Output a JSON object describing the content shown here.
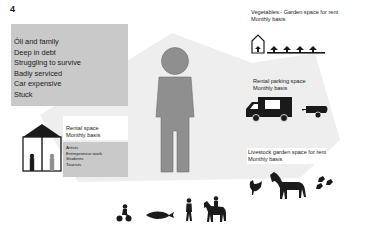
{
  "page": {
    "number": "4"
  },
  "status": {
    "lines": [
      "Óli and family",
      "Deep in debt",
      "Struggling to survive",
      "Badly serviced",
      "Car expensive",
      "Stuck"
    ]
  },
  "offers": {
    "vegetables": {
      "title": "Vegetables - Garden space for rent",
      "basis": "Monthly basis",
      "icon": "greenhouse-plants-icon"
    },
    "parking": {
      "title": "Rental parking space",
      "basis": "Monthly basis",
      "icon": "camper-trailer-icon"
    },
    "livestock": {
      "title": "Livestock garden space for rent",
      "basis": "Monthly basis",
      "icon": "horse-chickens-birds-icon"
    },
    "rental": {
      "title": "Rental space",
      "basis": "Monthly basis",
      "uses": [
        "Artists",
        "Entrepreneur work",
        "Students",
        "Tourists"
      ],
      "icon": "house-people-icon"
    }
  },
  "bottom_icons": [
    "child-tricycle-icon",
    "fish-icon",
    "person-walking-icon",
    "horse-rider-icon"
  ],
  "colors": {
    "figure": "#8f8f8f",
    "box": "#c9c9c9",
    "house_shape": "#ededed",
    "ink": "#1a1a1a"
  }
}
